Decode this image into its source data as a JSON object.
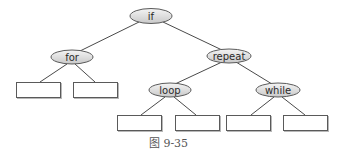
{
  "diagram": {
    "type": "tree",
    "colors": {
      "edge": "#4a4a4a",
      "node_border": "#5a5a5a",
      "node_fill_top": "#f4f4f4",
      "node_fill_bottom": "#c9c9c9",
      "leaf_fill": "#ffffff",
      "caption": "#555555"
    },
    "nodes": [
      {
        "id": "if",
        "label": "if",
        "cx": 151,
        "cy": 16,
        "rx": 21,
        "ry": 7.5
      },
      {
        "id": "for",
        "label": "for",
        "cx": 72,
        "cy": 57,
        "rx": 21,
        "ry": 7
      },
      {
        "id": "repeat",
        "label": "repeat",
        "cx": 229,
        "cy": 56,
        "rx": 22,
        "ry": 7
      },
      {
        "id": "loop",
        "label": "loop",
        "cx": 170,
        "cy": 90,
        "rx": 21,
        "ry": 7
      },
      {
        "id": "while",
        "label": "while",
        "cx": 278,
        "cy": 90,
        "rx": 22,
        "ry": 7
      }
    ],
    "leaves": [
      {
        "id": "for-left",
        "parent": "for",
        "x": 16,
        "y": 82,
        "w": 44,
        "h": 15
      },
      {
        "id": "for-right",
        "parent": "for",
        "x": 73,
        "y": 82,
        "w": 44,
        "h": 15
      },
      {
        "id": "loop-left",
        "parent": "loop",
        "x": 117,
        "y": 115,
        "w": 44,
        "h": 15
      },
      {
        "id": "loop-right",
        "parent": "loop",
        "x": 175,
        "y": 115,
        "w": 44,
        "h": 15
      },
      {
        "id": "while-left",
        "parent": "while",
        "x": 226,
        "y": 115,
        "w": 44,
        "h": 15
      },
      {
        "id": "while-right",
        "parent": "while",
        "x": 283,
        "y": 115,
        "w": 44,
        "h": 15
      }
    ],
    "edges": [
      {
        "from": "if",
        "to": "for",
        "x1": 139,
        "y1": 22,
        "x2": 80,
        "y2": 51
      },
      {
        "from": "if",
        "to": "repeat",
        "x1": 163,
        "y1": 22,
        "x2": 222,
        "y2": 50
      },
      {
        "from": "for",
        "to": "for-left",
        "x1": 67,
        "y1": 64,
        "x2": 40,
        "y2": 82
      },
      {
        "from": "for",
        "to": "for-right",
        "x1": 75,
        "y1": 64,
        "x2": 95,
        "y2": 82
      },
      {
        "from": "repeat",
        "to": "loop",
        "x1": 222,
        "y1": 62,
        "x2": 175,
        "y2": 84
      },
      {
        "from": "repeat",
        "to": "while",
        "x1": 236,
        "y1": 62,
        "x2": 272,
        "y2": 84
      },
      {
        "from": "loop",
        "to": "loop-left",
        "x1": 165,
        "y1": 97,
        "x2": 141,
        "y2": 115
      },
      {
        "from": "loop",
        "to": "loop-right",
        "x1": 174,
        "y1": 97,
        "x2": 196,
        "y2": 115
      },
      {
        "from": "while",
        "to": "while-left",
        "x1": 274,
        "y1": 97,
        "x2": 251,
        "y2": 115
      },
      {
        "from": "while",
        "to": "while-right",
        "x1": 282,
        "y1": 97,
        "x2": 305,
        "y2": 115
      }
    ]
  },
  "caption": "图 9-35"
}
